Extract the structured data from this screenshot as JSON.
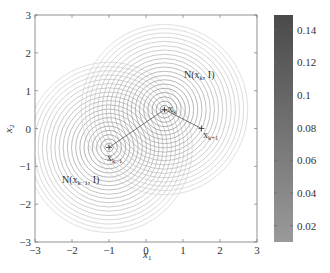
{
  "chart_data": {
    "type": "contour",
    "title": "",
    "xlabel": "x1",
    "ylabel": "x2",
    "xlim": [
      -3,
      3
    ],
    "ylim": [
      -3,
      3
    ],
    "xticks": [
      "−3",
      "−2",
      "−1",
      "0",
      "1",
      "2",
      "3"
    ],
    "yticks": [
      "−3",
      "−2",
      "−1",
      "0",
      "1",
      "2",
      "3"
    ],
    "grid": false,
    "series": [
      {
        "name": "N(x_{k−1}, I)",
        "center": [
          -1,
          -0.5
        ],
        "label_pos": [
          -2.4,
          -1.5
        ],
        "rings": 20,
        "max_radius": 2.25
      },
      {
        "name": "N(x_k, I)",
        "center": [
          0.5,
          0.5
        ],
        "label_pos": [
          0.8,
          1.05
        ],
        "rings": 20,
        "max_radius": 2.25
      }
    ],
    "points": [
      {
        "name": "x_{k−1}",
        "x": -1,
        "y": -0.5
      },
      {
        "name": "x_k",
        "x": 0.5,
        "y": 0.5
      },
      {
        "name": "x_{k+1}",
        "x": 1.5,
        "y": 0
      }
    ],
    "path": [
      [
        -1,
        -0.5
      ],
      [
        0.5,
        0.5
      ],
      [
        1.5,
        0
      ]
    ],
    "colorbar": {
      "min": 0.01,
      "max": 0.149,
      "ticks": [
        "0.02",
        "0.04",
        "0.06",
        "0.08",
        "0.1",
        "0.12",
        "0.14"
      ],
      "color_low": "#9a9a9a",
      "color_high": "#4a4a4a"
    }
  },
  "labels": {
    "xlabel": "x",
    "xlabel_sub": "1",
    "ylabel": "x",
    "ylabel_sub": "2",
    "ann_left": "N(x",
    "ann_left_sub": "k−1",
    "ann_left_tail": ", I)",
    "ann_right": "N(x",
    "ann_right_sub": "k",
    "ann_right_tail": ", I)",
    "pt_k": "x",
    "pt_k_sub": "k",
    "pt_km1": "x",
    "pt_km1_sub": "k−1",
    "pt_kp1": "x",
    "pt_kp1_sub": "k+1"
  }
}
